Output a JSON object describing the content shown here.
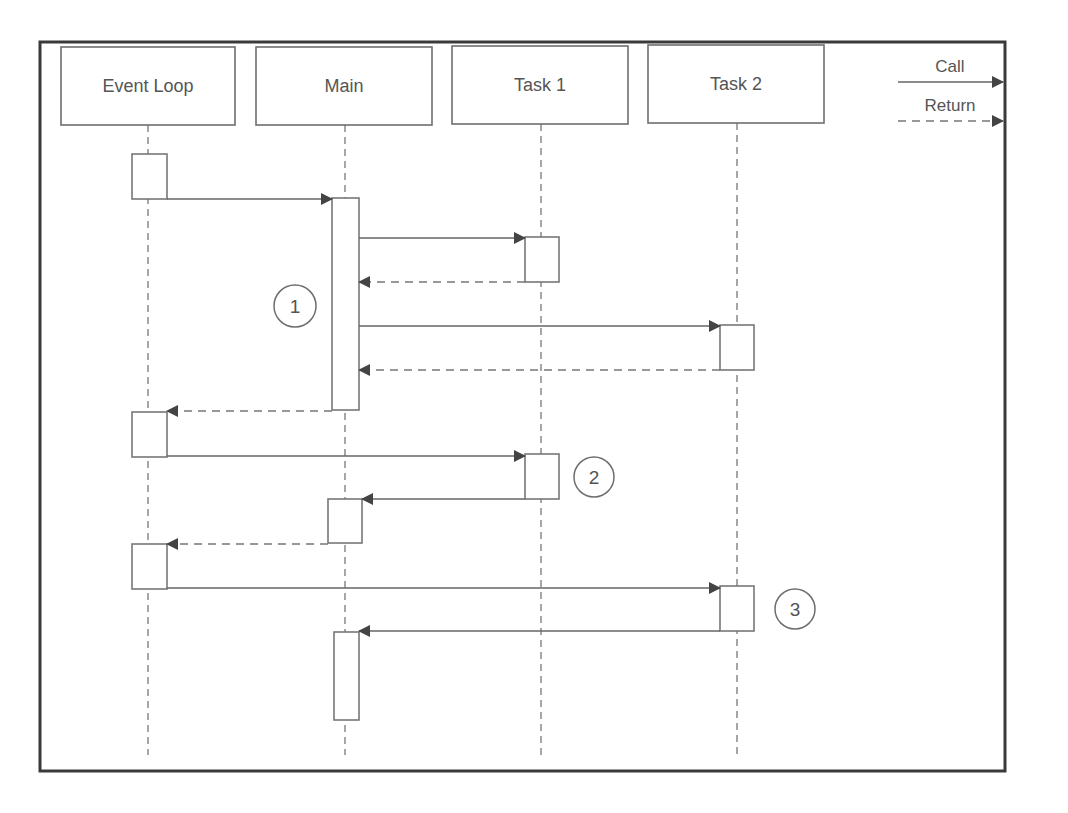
{
  "diagram": {
    "type": "sequence-diagram",
    "frame": {
      "x": 40,
      "y": 42,
      "w": 965,
      "h": 729
    },
    "colors": {
      "stroke": "#666666",
      "text": "#555555",
      "arrowhead": "#444444",
      "frame": "#3a3a3a"
    },
    "participants": [
      {
        "id": "event_loop",
        "label": "Event Loop",
        "x": 61,
        "y": 47,
        "w": 174,
        "h": 78,
        "lifeline_x": 148
      },
      {
        "id": "main",
        "label": "Main",
        "x": 256,
        "y": 47,
        "w": 176,
        "h": 78,
        "lifeline_x": 345
      },
      {
        "id": "task1",
        "label": "Task 1",
        "x": 452,
        "y": 46,
        "w": 176,
        "h": 78,
        "lifeline_x": 541
      },
      {
        "id": "task2",
        "label": "Task 2",
        "x": 648,
        "y": 45,
        "w": 176,
        "h": 78,
        "lifeline_x": 737
      }
    ],
    "lifeline_end_y": 755,
    "activations": [
      {
        "participant": "event_loop",
        "x": 132,
        "y": 154,
        "w": 35,
        "h": 45
      },
      {
        "participant": "main",
        "x": 332,
        "y": 198,
        "w": 27,
        "h": 212
      },
      {
        "participant": "task1",
        "x": 525,
        "y": 237,
        "w": 34,
        "h": 45
      },
      {
        "participant": "task2",
        "x": 720,
        "y": 325,
        "w": 34,
        "h": 45
      },
      {
        "participant": "event_loop",
        "x": 132,
        "y": 412,
        "w": 35,
        "h": 45
      },
      {
        "participant": "task1",
        "x": 525,
        "y": 454,
        "w": 34,
        "h": 45
      },
      {
        "participant": "main",
        "x": 328,
        "y": 499,
        "w": 34,
        "h": 44
      },
      {
        "participant": "event_loop",
        "x": 132,
        "y": 544,
        "w": 35,
        "h": 45
      },
      {
        "participant": "task2",
        "x": 720,
        "y": 586,
        "w": 34,
        "h": 45
      },
      {
        "participant": "main",
        "x": 334,
        "y": 632,
        "w": 25,
        "h": 88
      }
    ],
    "messages": [
      {
        "kind": "call",
        "from": "event_loop",
        "to": "main",
        "x1": 167,
        "x2": 332,
        "y": 199
      },
      {
        "kind": "call",
        "from": "main",
        "to": "task1",
        "x1": 359,
        "x2": 525,
        "y": 238
      },
      {
        "kind": "return",
        "from": "task1",
        "to": "main",
        "x1": 525,
        "x2": 359,
        "y": 282
      },
      {
        "kind": "call",
        "from": "main",
        "to": "task2",
        "x1": 359,
        "x2": 720,
        "y": 326
      },
      {
        "kind": "return",
        "from": "task2",
        "to": "main",
        "x1": 720,
        "x2": 359,
        "y": 370
      },
      {
        "kind": "return",
        "from": "main",
        "to": "event_loop",
        "x1": 332,
        "x2": 167,
        "y": 411
      },
      {
        "kind": "call",
        "from": "event_loop",
        "to": "task1",
        "x1": 167,
        "x2": 525,
        "y": 456
      },
      {
        "kind": "call",
        "from": "task1",
        "to": "main",
        "x1": 525,
        "x2": 362,
        "y": 499
      },
      {
        "kind": "return",
        "from": "main",
        "to": "event_loop",
        "x1": 328,
        "x2": 167,
        "y": 544
      },
      {
        "kind": "call",
        "from": "event_loop",
        "to": "task2",
        "x1": 167,
        "x2": 720,
        "y": 588
      },
      {
        "kind": "call",
        "from": "task2",
        "to": "main",
        "x1": 720,
        "x2": 359,
        "y": 631
      }
    ],
    "annotations": [
      {
        "label": "1",
        "cx": 295,
        "cy": 306,
        "r": 21
      },
      {
        "label": "2",
        "cx": 594,
        "cy": 477,
        "r": 20
      },
      {
        "label": "3",
        "cx": 795,
        "cy": 609,
        "r": 20
      }
    ],
    "legend": {
      "items": [
        {
          "kind": "call",
          "label": "Call",
          "x1": 898,
          "x2": 1003,
          "y": 82,
          "label_x": 950,
          "label_y": 72
        },
        {
          "kind": "return",
          "label": "Return",
          "x1": 898,
          "x2": 1003,
          "y": 121,
          "label_x": 950,
          "label_y": 111
        }
      ]
    }
  }
}
